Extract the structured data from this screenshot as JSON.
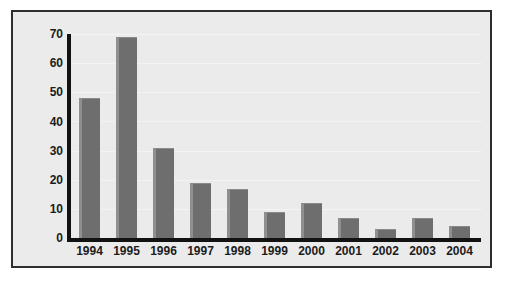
{
  "chart_data": {
    "type": "bar",
    "title": "",
    "subtitle": "",
    "xlabel": "",
    "ylabel": "",
    "categories": [
      "1994",
      "1995",
      "1996",
      "1997",
      "1998",
      "1999",
      "2000",
      "2001",
      "2002",
      "2003",
      "2004"
    ],
    "values": [
      48,
      69,
      31,
      19,
      17,
      9,
      12,
      7,
      3,
      7,
      4
    ],
    "ylim": [
      0,
      70
    ],
    "ytick_labels": [
      "70",
      "60",
      "50",
      "40",
      "30",
      "20",
      "10",
      "0"
    ],
    "ytick_values": [
      70,
      60,
      50,
      40,
      30,
      20,
      10,
      0
    ],
    "ytick_step": 10,
    "grid": true,
    "legend": null,
    "legend_position": "none",
    "annotations": [],
    "colors": {
      "bar_fill": "#6e6e6e",
      "bar_highlight": "#8f8f8f",
      "axis": "#121212",
      "plot_background": "#ebebeb",
      "frame_border": "#2e2e2e",
      "page_background": "#ffffff",
      "gridline": "#f3f3f3",
      "tick_label": "#1c1c1c"
    }
  }
}
